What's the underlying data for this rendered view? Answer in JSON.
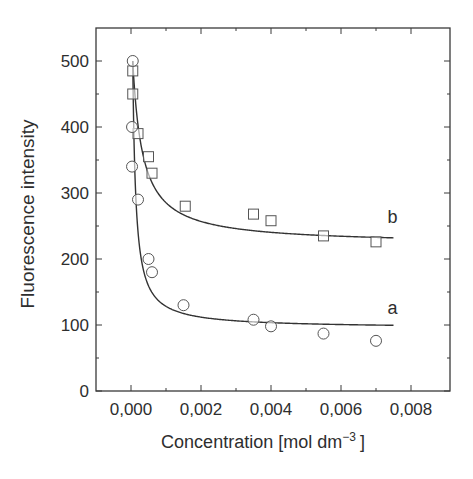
{
  "chart_data": {
    "type": "scatter",
    "title": "",
    "xlabel": "Concentration [mol dm",
    "xlabel_superscript": "−3",
    "xlabel_close": "]",
    "ylabel": "Fluorescence intensity",
    "xlim": [
      -0.001,
      0.009
    ],
    "ylim": [
      0,
      550
    ],
    "x_ticks": [
      0.0,
      0.002,
      0.004,
      0.006,
      0.008
    ],
    "x_tick_labels": [
      "0,000",
      "0,002",
      "0,004",
      "0,006",
      "0,008"
    ],
    "x_minor_ticks": [
      0.001,
      0.003,
      0.005,
      0.007
    ],
    "y_ticks": [
      0,
      100,
      200,
      300,
      400,
      500
    ],
    "y_tick_labels": [
      "0",
      "100",
      "200",
      "300",
      "400",
      "500"
    ],
    "y_minor_ticks": [
      50,
      150,
      250,
      350,
      450
    ],
    "grid": false,
    "legend": "curve labels placed at right end of fitted lines",
    "series": [
      {
        "name": "b",
        "marker": "square",
        "label_pos": [
          0.0071,
          255
        ],
        "points": [
          [
            5e-05,
            485
          ],
          [
            5e-05,
            450
          ],
          [
            0.0002,
            390
          ],
          [
            0.0005,
            355
          ],
          [
            0.0006,
            330
          ],
          [
            0.00155,
            280
          ],
          [
            0.0035,
            268
          ],
          [
            0.004,
            258
          ],
          [
            0.0055,
            235
          ],
          [
            0.007,
            226
          ]
        ],
        "fit": {
          "model": "hyperbolic decay",
          "I0": 500,
          "Iinf": 222,
          "k": 0.00028,
          "x_end": 0.0075
        }
      },
      {
        "name": "a",
        "marker": "circle",
        "label_pos": [
          0.0071,
          117
        ],
        "points": [
          [
            5e-05,
            500
          ],
          [
            3e-05,
            400
          ],
          [
            3e-05,
            340
          ],
          [
            0.0002,
            290
          ],
          [
            0.0005,
            200
          ],
          [
            0.0006,
            180
          ],
          [
            0.0015,
            130
          ],
          [
            0.0035,
            108
          ],
          [
            0.004,
            98
          ],
          [
            0.0055,
            87
          ],
          [
            0.007,
            76
          ]
        ],
        "fit": {
          "model": "hyperbolic decay",
          "I0": 500,
          "Iinf": 95,
          "k": 8.5e-05,
          "x_end": 0.0075
        }
      }
    ]
  }
}
